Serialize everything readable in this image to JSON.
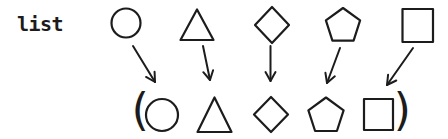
{
  "label": {
    "text": "list"
  },
  "parens": {
    "open": "(",
    "close": ")"
  },
  "diagram": {
    "top_row_shapes": [
      "circle",
      "triangle",
      "diamond",
      "pentagon",
      "square"
    ],
    "bottom_row_shapes": [
      "circle",
      "triangle",
      "diamond",
      "pentagon",
      "square"
    ],
    "arrow_count": 5,
    "arrow_direction": "down"
  },
  "colors": {
    "ink": "#1c1c1c",
    "background": "#ffffff"
  }
}
